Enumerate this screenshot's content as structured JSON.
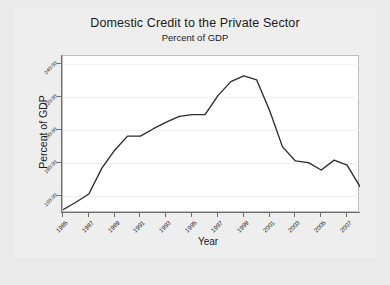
{
  "chart_data": {
    "type": "line",
    "title": "Domestic Credit to the Private Sector",
    "subtitle": "Percent of GDP",
    "xlabel": "Year",
    "ylabel": "Percent of GDP",
    "grid": "horizontal",
    "legend": null,
    "line_color": "#2b2b2b",
    "plot_background": "#ffffff",
    "graph_background": "#eeeeee",
    "xlim": [
      1985,
      2008
    ],
    "ylim": [
      150,
      245
    ],
    "xticks": [
      1985,
      1987,
      1989,
      1991,
      1993,
      1995,
      1997,
      1999,
      2001,
      2003,
      2005,
      2007
    ],
    "xticklabels": [
      "1985",
      "1987",
      "1989",
      "1991",
      "1993",
      "1995",
      "1997",
      "1999",
      "2001",
      "2003",
      "2005",
      "2007"
    ],
    "yticks": [
      160,
      180,
      200,
      220,
      240
    ],
    "yticklabels": [
      "160.00",
      "180.00",
      "200.00",
      "220.00",
      "240.00"
    ],
    "x": [
      1985,
      1986,
      1987,
      1988,
      1989,
      1990,
      1991,
      1992,
      1993,
      1994,
      1995,
      1996,
      1997,
      1998,
      1999,
      2000,
      2001,
      2002,
      2003,
      2004,
      2005,
      2006,
      2007,
      2008
    ],
    "values": [
      152.0,
      156.5,
      161.5,
      177.0,
      188.0,
      196.5,
      196.5,
      201.0,
      205.0,
      208.5,
      209.5,
      209.5,
      221.0,
      229.5,
      233.0,
      230.5,
      212.0,
      190.0,
      181.5,
      180.5,
      176.0,
      182.0,
      179.0,
      166.0
    ]
  }
}
